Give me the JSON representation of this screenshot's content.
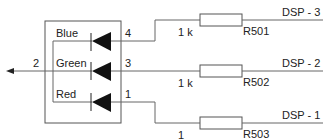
{
  "diagram": {
    "type": "schematic",
    "component": "RGB LED with series resistors",
    "common_pin": {
      "label": "2",
      "direction": "left-arrow"
    },
    "leds": [
      {
        "color_label": "Blue",
        "pin": "4",
        "resistor_value": "1 k",
        "resistor_ref": "R501",
        "signal": "DSP - 3"
      },
      {
        "color_label": "Green",
        "pin": "3",
        "resistor_value": "1 k",
        "resistor_ref": "R502",
        "signal": "DSP - 2"
      },
      {
        "color_label": "Red",
        "pin": "1",
        "resistor_value": "1",
        "resistor_ref": "R503",
        "signal": "DSP - 1"
      }
    ],
    "colors": {
      "wire": "#666666",
      "diode": "#111111",
      "text": "#222222",
      "background": "#ffffff"
    }
  }
}
